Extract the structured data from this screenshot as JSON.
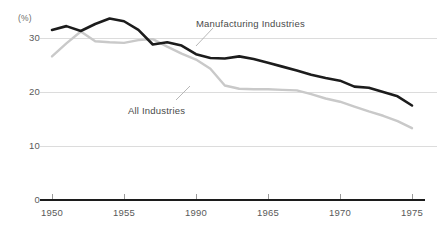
{
  "chart_data": {
    "type": "line",
    "title": "",
    "subtitle": "",
    "xlabel": "",
    "ylabel": "",
    "unit_label": "(%)",
    "grid": true,
    "gridlines_y": [
      30,
      20,
      10
    ],
    "legend_position": "inline-annotation",
    "xlim": [
      1950,
      1975
    ],
    "ylim": [
      0,
      34
    ],
    "y_ticks": [
      30,
      20,
      10,
      0
    ],
    "y_tick_labels": [
      "30",
      "20",
      "10",
      "0"
    ],
    "x_ticks": [
      1950,
      1955,
      1960,
      1965,
      1970,
      1975
    ],
    "x_tick_labels": [
      "1950",
      "1955",
      "1990",
      "1965",
      "1970",
      "1975"
    ],
    "x": [
      1950,
      1951,
      1952,
      1953,
      1954,
      1955,
      1956,
      1957,
      1958,
      1959,
      1960,
      1961,
      1962,
      1963,
      1964,
      1965,
      1966,
      1967,
      1968,
      1969,
      1970,
      1971,
      1972,
      1973,
      1974,
      1975
    ],
    "series": [
      {
        "name": "Manufacturing Industries",
        "color": "#1c1c1c",
        "values": [
          31.5,
          32.2,
          31.3,
          32.6,
          33.6,
          33.1,
          31.5,
          28.8,
          29.2,
          28.6,
          27.0,
          26.3,
          26.2,
          26.6,
          26.1,
          25.4,
          24.7,
          24.0,
          23.2,
          22.6,
          22.1,
          21.0,
          20.8,
          20.0,
          19.2,
          17.5
        ]
      },
      {
        "name": "All Industries",
        "color": "#c9c9c9",
        "values": [
          26.6,
          29.0,
          31.2,
          29.4,
          29.2,
          29.1,
          29.6,
          29.8,
          28.4,
          27.1,
          26.0,
          24.3,
          21.2,
          20.6,
          20.5,
          20.5,
          20.4,
          20.3,
          19.6,
          18.8,
          18.2,
          17.3,
          16.4,
          15.6,
          14.6,
          13.3
        ]
      }
    ],
    "annotations": [
      {
        "text": "Manufacturing Industries",
        "target_series": "Manufacturing Industries",
        "label_x": 196,
        "label_y": 19
      },
      {
        "text": "All Industries",
        "target_series": "All Industries",
        "label_x": 128,
        "label_y": 106
      }
    ],
    "colors": {
      "manufacturing_line": "#1c1c1c",
      "all_industries_line": "#c9c9c9",
      "gridline": "#dcdcdc",
      "axis": "#1c1c1c",
      "tick_text": "#5a5a5a",
      "annotation_text": "#4a4a4a",
      "leader_line": "#b0b0b0",
      "background": "#ffffff"
    }
  }
}
